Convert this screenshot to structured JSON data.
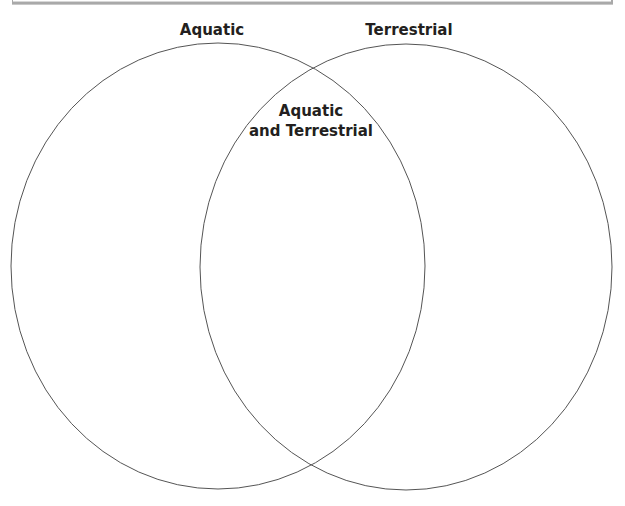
{
  "diagram": {
    "type": "venn",
    "sets": [
      {
        "id": "left",
        "label": "Aquatic"
      },
      {
        "id": "right",
        "label": "Terrestrial"
      }
    ],
    "intersection": {
      "label_lines": [
        "Aquatic",
        "and Terrestrial"
      ]
    },
    "colors": {
      "outline": "#555555",
      "text": "#231f20",
      "box_border": "#a9a9a9"
    }
  }
}
